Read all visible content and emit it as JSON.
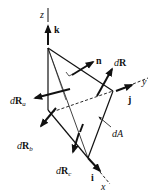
{
  "diagram": {
    "axes": {
      "x": {
        "label": "x",
        "unit_vector": "i"
      },
      "y": {
        "label": "y",
        "unit_vector": "j"
      },
      "z": {
        "label": "z",
        "unit_vector": "k"
      }
    },
    "labels": {
      "z_axis": "z",
      "y_axis": "y",
      "x_axis": "x",
      "k": "k",
      "j": "j",
      "i": "i",
      "n": "n",
      "dR_d": "d",
      "dR_R": "R",
      "dRa_d": "d",
      "dRa_R": "R",
      "dRa_sub": "a",
      "dRb_d": "d",
      "dRb_R": "R",
      "dRb_sub": "b",
      "dRc_d": "d",
      "dRc_R": "R",
      "dRc_sub": "c",
      "dA": "dA"
    },
    "colors": {
      "ink": "#111111",
      "background": "#ffffff"
    }
  }
}
